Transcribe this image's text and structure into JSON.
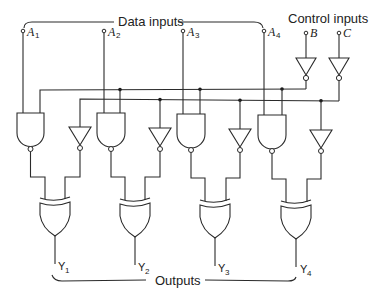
{
  "title_labels": {
    "data_inputs": "Data inputs",
    "control_inputs": "Control inputs",
    "outputs": "Outputs"
  },
  "inputs": {
    "data": [
      {
        "name": "A",
        "sub": "1"
      },
      {
        "name": "A",
        "sub": "2"
      },
      {
        "name": "A",
        "sub": "3"
      },
      {
        "name": "A",
        "sub": "4"
      }
    ],
    "control": [
      {
        "name": "B"
      },
      {
        "name": "C"
      }
    ]
  },
  "outputs": [
    {
      "name": "Y",
      "sub": "1"
    },
    {
      "name": "Y",
      "sub": "2"
    },
    {
      "name": "Y",
      "sub": "3"
    },
    {
      "name": "Y",
      "sub": "4"
    }
  ],
  "gates": {
    "nand_count": 4,
    "not_count": 6,
    "xor_count": 4
  },
  "colors": {
    "ink": "#2a2a2a",
    "background": "#ffffff"
  }
}
